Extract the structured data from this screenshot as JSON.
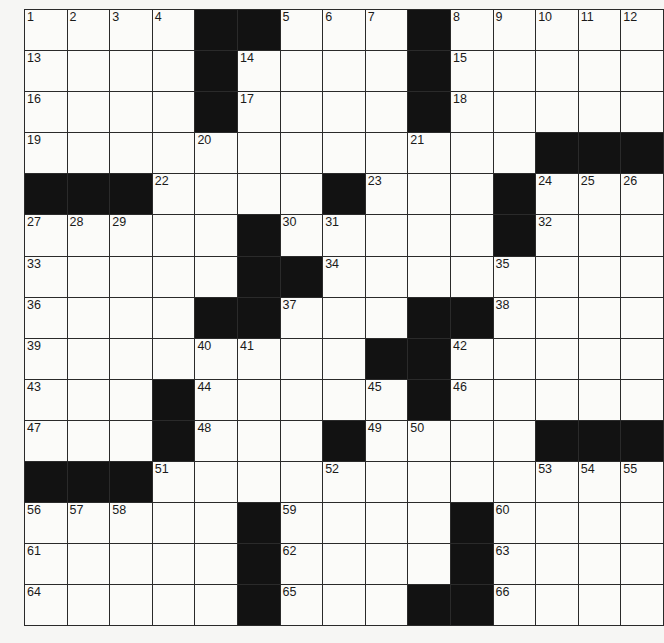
{
  "puzzle": {
    "rows": 15,
    "cols": 15,
    "colors": {
      "black_cell": "#121212",
      "white_cell": "#fbfbf9",
      "grid_line": "#2a2a2a",
      "background": "#f6f6f4"
    },
    "layout": [
      "1 2 3 4 # # 5 6 7 # 8 9 10 11 12",
      "13 . . . # 14 . . . # 15 . . . .",
      "16 . . . # 17 . . . # 18 . . . .",
      "19 . . . 20 . . . . 21 . . # # #",
      "# # # 22 . . . # 23 . . # 24 25 26",
      "27 28 29 . . # 30 31 . . . # 32 . .",
      "33 . . . . # # 34 . . . 35 . . .",
      "36 . . . # # 37 . . # # 38 . . .",
      "39 . . . 40 41 . . # # 42 . . . .",
      "43 . . # 44 . . . 45 # 46 . . . .",
      "47 . . # 48 . . # 49 50 . . # # #",
      "# # # 51 . . . 52 . . . . 53 54 55",
      "56 57 58 . . # 59 . . . # 60 . . .",
      "61 . . . . # 62 . . . # 63 . . .",
      "64 . . . . # 65 . . # # 66 . . ."
    ]
  }
}
